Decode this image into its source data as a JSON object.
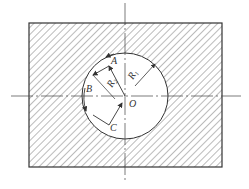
{
  "diagram": {
    "type": "machining-toolpath-sketch",
    "labels": {
      "A": "A",
      "B": "B",
      "C": "C",
      "O": "O",
      "R1": "R",
      "R1_sub": "1",
      "R2": "R",
      "R2_sub": "2"
    },
    "colors": {
      "line": "#333333",
      "hatch": "#555555",
      "background": "#ffffff"
    }
  }
}
